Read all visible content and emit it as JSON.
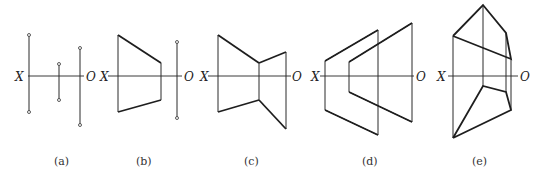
{
  "figures": [
    {
      "id": "a",
      "caption": "(a)",
      "axis_left": "X",
      "axis_right": "O"
    },
    {
      "id": "b",
      "caption": "(b)",
      "axis_left": "X",
      "axis_right": "O"
    },
    {
      "id": "c",
      "caption": "(c)",
      "axis_left": "X",
      "axis_right": "O"
    },
    {
      "id": "d",
      "caption": "(d)",
      "axis_left": "X",
      "axis_right": "O"
    },
    {
      "id": "e",
      "caption": "(e)",
      "axis_left": "X",
      "axis_right": "O"
    }
  ]
}
